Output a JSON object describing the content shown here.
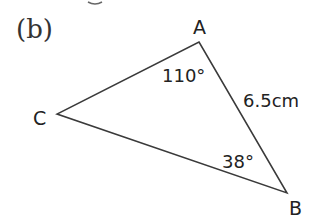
{
  "figure": {
    "part_label": "(b)",
    "vertices": {
      "A": {
        "label": "A",
        "x": 199,
        "y": 42
      },
      "B": {
        "label": "B",
        "x": 287,
        "y": 193
      },
      "C": {
        "label": "C",
        "x": 57,
        "y": 114
      }
    },
    "angle_A": "110°",
    "angle_B": "38°",
    "side_AB": "6.5cm",
    "colors": {
      "line": "#3a3a3a",
      "text": "#222222"
    }
  }
}
